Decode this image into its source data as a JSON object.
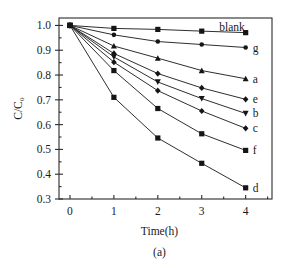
{
  "figure": {
    "caption": "(a)"
  },
  "chart_data": {
    "type": "line",
    "title": "",
    "xlabel": "Time(h)",
    "ylabel": "C/C0",
    "ylabel_display": "C/C₀",
    "xlim": [
      -0.25,
      4.6
    ],
    "ylim": [
      0.3,
      1.03
    ],
    "xticks": [
      0,
      1,
      2,
      3,
      4
    ],
    "xtick_labels": [
      "0",
      "1",
      "2",
      "3",
      "4"
    ],
    "yticks": [
      0.3,
      0.4,
      0.5,
      0.6,
      0.7,
      0.8,
      0.9,
      1.0
    ],
    "ytick_labels": [
      "0.3",
      "0.4",
      "0.5",
      "0.6",
      "0.7",
      "0.8",
      "0.9",
      "1.0"
    ],
    "grid": false,
    "legend_position": "right-of-curve-ends",
    "x": [
      0,
      1,
      2,
      3,
      4
    ],
    "series": [
      {
        "name": "blank",
        "label": "blank",
        "marker": "square",
        "values": [
          1.0,
          0.988,
          0.984,
          0.977,
          0.971
        ]
      },
      {
        "name": "g",
        "label": "g",
        "marker": "circle",
        "values": [
          1.0,
          0.962,
          0.935,
          0.923,
          0.911
        ]
      },
      {
        "name": "a",
        "label": "a",
        "marker": "triangle",
        "values": [
          1.0,
          0.917,
          0.868,
          0.818,
          0.785
        ]
      },
      {
        "name": "e",
        "label": "e",
        "marker": "diamond",
        "values": [
          1.0,
          0.887,
          0.806,
          0.748,
          0.702
        ]
      },
      {
        "name": "b",
        "label": "b",
        "marker": "triangle-down",
        "values": [
          1.0,
          0.873,
          0.772,
          0.705,
          0.645
        ]
      },
      {
        "name": "c",
        "label": "c",
        "marker": "diamond",
        "values": [
          1.0,
          0.852,
          0.737,
          0.655,
          0.585
        ]
      },
      {
        "name": "f",
        "label": "f",
        "marker": "square",
        "values": [
          1.0,
          0.818,
          0.665,
          0.563,
          0.496
        ]
      },
      {
        "name": "d",
        "label": "d",
        "marker": "square",
        "values": [
          1.0,
          0.71,
          0.546,
          0.444,
          0.345
        ]
      }
    ],
    "colors": {
      "line": "#232323",
      "marker": "#151515",
      "axis": "#2b2b2b",
      "background": "#ffffff"
    }
  }
}
